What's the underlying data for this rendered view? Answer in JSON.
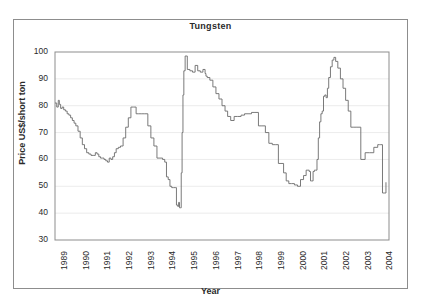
{
  "figure": {
    "title": "Tungsten",
    "frame_color": "#8d8d8d",
    "background": "#ffffff"
  },
  "chart_data": {
    "type": "line",
    "title": "Tungsten",
    "xlabel": "Year",
    "ylabel": "Price US$/short ton",
    "xlim": [
      1989,
      2004.4
    ],
    "ylim": [
      30,
      100
    ],
    "yticks": [
      30,
      40,
      50,
      60,
      70,
      80,
      90,
      100
    ],
    "xticks": [
      1989,
      1990,
      1991,
      1992,
      1993,
      1994,
      1995,
      1996,
      1997,
      1998,
      1999,
      2000,
      2001,
      2002,
      2003,
      2004
    ],
    "grid": "horizontal-faint",
    "legend": "none",
    "line_color": "#6b6b6b",
    "series": [
      {
        "name": "Tungsten price",
        "x": [
          1989.0,
          1989.08,
          1989.15,
          1989.2,
          1989.26,
          1989.33,
          1989.4,
          1989.48,
          1989.56,
          1989.64,
          1989.72,
          1989.8,
          1989.88,
          1989.96,
          1990.06,
          1990.16,
          1990.26,
          1990.36,
          1990.46,
          1990.56,
          1990.66,
          1990.76,
          1990.86,
          1990.94,
          1991.02,
          1991.1,
          1991.18,
          1991.26,
          1991.34,
          1991.42,
          1991.5,
          1991.58,
          1991.66,
          1991.74,
          1991.82,
          1991.92,
          1992.02,
          1992.14,
          1992.26,
          1992.38,
          1992.5,
          1992.62,
          1992.74,
          1992.86,
          1993.0,
          1993.14,
          1993.28,
          1993.42,
          1993.56,
          1993.7,
          1993.84,
          1993.96,
          1994.06,
          1994.14,
          1994.22,
          1994.3,
          1994.38,
          1994.46,
          1994.54,
          1994.6,
          1994.66,
          1994.7,
          1994.74,
          1994.78,
          1994.82,
          1994.86,
          1994.9,
          1994.94,
          1995.0,
          1995.1,
          1995.22,
          1995.34,
          1995.46,
          1995.58,
          1995.7,
          1995.82,
          1995.92,
          1995.96,
          1996.02,
          1996.14,
          1996.28,
          1996.42,
          1996.56,
          1996.7,
          1996.84,
          1996.96,
          1997.1,
          1997.26,
          1997.42,
          1997.58,
          1997.74,
          1997.9,
          1998.06,
          1998.22,
          1998.38,
          1998.54,
          1998.7,
          1998.86,
          1999.02,
          1999.18,
          1999.3,
          1999.42,
          1999.54,
          1999.66,
          1999.78,
          1999.9,
          2000.04,
          2000.18,
          2000.32,
          2000.46,
          2000.58,
          2000.66,
          2000.72,
          2000.78,
          2000.84,
          2000.9,
          2000.96,
          2001.02,
          2001.08,
          2001.14,
          2001.2,
          2001.26,
          2001.32,
          2001.38,
          2001.44,
          2001.5,
          2001.56,
          2001.62,
          2001.7,
          2001.78,
          2001.86,
          2001.94,
          2002.04,
          2002.16,
          2002.28,
          2002.4,
          2002.52,
          2002.64,
          2002.78,
          2002.92,
          2003.1,
          2003.3,
          2003.5,
          2003.7,
          2003.88,
          2003.96,
          2004.02,
          2004.1,
          2004.18,
          2004.26
        ],
        "y": [
          81.0,
          79.5,
          82.0,
          80.5,
          79.0,
          79.5,
          78.5,
          78.0,
          77.0,
          76.5,
          75.5,
          74.5,
          73.5,
          72.5,
          70.5,
          68.0,
          65.5,
          64.0,
          62.5,
          62.0,
          61.5,
          61.5,
          62.5,
          62.0,
          61.0,
          60.5,
          60.5,
          60.0,
          59.5,
          59.0,
          60.5,
          60.0,
          61.0,
          62.5,
          64.0,
          64.5,
          65.0,
          68.0,
          72.0,
          75.5,
          79.5,
          79.5,
          77.0,
          77.0,
          77.0,
          77.0,
          72.5,
          68.0,
          65.0,
          60.5,
          60.5,
          60.0,
          59.0,
          53.5,
          52.5,
          50.0,
          49.5,
          49.5,
          49.5,
          43.0,
          42.5,
          44.0,
          42.0,
          42.0,
          55.0,
          70.0,
          84.0,
          93.0,
          98.5,
          93.5,
          93.0,
          92.5,
          95.0,
          93.0,
          92.5,
          93.5,
          92.0,
          91.0,
          90.5,
          89.5,
          87.0,
          84.5,
          82.5,
          80.0,
          78.0,
          76.0,
          74.5,
          76.0,
          76.0,
          76.5,
          77.0,
          77.0,
          77.5,
          77.5,
          72.5,
          72.5,
          70.0,
          66.0,
          65.5,
          65.5,
          58.5,
          58.5,
          55.0,
          52.0,
          51.0,
          51.0,
          50.5,
          50.0,
          52.5,
          54.0,
          56.0,
          56.0,
          55.5,
          52.0,
          52.0,
          55.5,
          56.0,
          56.0,
          60.0,
          68.0,
          74.0,
          77.0,
          78.0,
          83.5,
          84.0,
          83.0,
          86.5,
          90.5,
          94.5,
          97.0,
          98.0,
          96.5,
          94.0,
          90.0,
          86.5,
          82.0,
          78.0,
          72.0,
          72.0,
          72.0,
          60.0,
          62.5,
          62.5,
          64.5,
          65.5,
          65.5,
          65.5,
          47.5,
          47.5,
          51.5
        ]
      }
    ]
  },
  "axes": {
    "ytick_labels": [
      "100",
      "90",
      "80",
      "70",
      "60",
      "50",
      "40",
      "30"
    ],
    "xtick_labels": [
      "1989",
      "1990",
      "1991",
      "1992",
      "1993",
      "1994",
      "1995",
      "1996",
      "1997",
      "1998",
      "1999",
      "2000",
      "2001",
      "2002",
      "2003",
      "2004"
    ]
  }
}
